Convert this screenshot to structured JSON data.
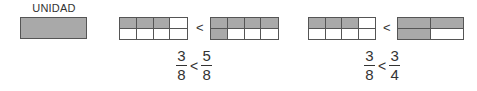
{
  "unit": {
    "label": "UNIDAD",
    "fill_color": "#a9a9a9"
  },
  "comparisons": [
    {
      "left_bar": {
        "cols": 4,
        "rows": 2,
        "shaded": [
          [
            1,
            1,
            1,
            0
          ],
          [
            0,
            0,
            0,
            0
          ]
        ]
      },
      "operator": "<",
      "right_bar": {
        "cols": 4,
        "rows": 2,
        "shaded": [
          [
            1,
            1,
            1,
            1
          ],
          [
            1,
            0,
            0,
            0
          ]
        ]
      },
      "fraction_left": {
        "numerator": "3",
        "denominator": "8"
      },
      "fraction_right": {
        "numerator": "5",
        "denominator": "8"
      }
    },
    {
      "left_bar": {
        "cols": 4,
        "rows": 2,
        "shaded": [
          [
            1,
            1,
            1,
            0
          ],
          [
            0,
            0,
            0,
            0
          ]
        ]
      },
      "operator": "<",
      "right_bar": {
        "cols": 2,
        "rows": 2,
        "shaded": [
          [
            1,
            1
          ],
          [
            1,
            0
          ]
        ]
      },
      "fraction_left": {
        "numerator": "3",
        "denominator": "8"
      },
      "fraction_right": {
        "numerator": "3",
        "denominator": "4"
      }
    }
  ]
}
